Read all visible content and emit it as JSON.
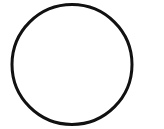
{
  "image": {
    "width": 164,
    "height": 129,
    "background_color": "#ffffff",
    "description": "A single black circle outline drawn on a plain white background"
  },
  "shapes": [
    {
      "name": "circle-outline",
      "type": "circle",
      "center_x": 72,
      "center_y": 64.5,
      "radius": 60,
      "stroke_color": "#111111",
      "stroke_width": 3,
      "fill": "none"
    }
  ],
  "text": {
    "labels": []
  }
}
